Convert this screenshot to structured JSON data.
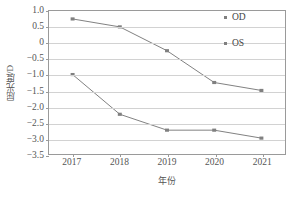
{
  "chart_data": {
    "type": "line",
    "title": "",
    "xlabel": "年份",
    "ylabel": "屈光度/D",
    "categories": [
      "2017",
      "2018",
      "2019",
      "2020",
      "2021"
    ],
    "series": [
      {
        "name": "OD",
        "values": [
          0.75,
          0.5,
          -0.25,
          -1.25,
          -1.5
        ],
        "marker": "square",
        "color": "#808080"
      },
      {
        "name": "OS",
        "values": [
          -1.0,
          -2.25,
          -2.75,
          -2.75,
          -3.0
        ],
        "marker": "square",
        "color": "#808080"
      }
    ],
    "ylim": [
      -3.5,
      1.0
    ],
    "ytick_labels": [
      "1.0",
      "0.5",
      "0",
      "-0.5",
      "-1.0",
      "-1.5",
      "-2.0",
      "-2.5",
      "-3.0",
      "-3.5"
    ],
    "ytick_values": [
      1.0,
      0.5,
      0,
      -0.5,
      -1.0,
      -1.5,
      -2.0,
      -2.5,
      -3.0,
      -3.5
    ],
    "grid": "horizontal",
    "legend_position": "top-right",
    "legend_entries": [
      "OD",
      "OS"
    ]
  },
  "axis": {
    "y_title": "屈光度/D",
    "x_title": "年份"
  },
  "colors": {
    "line": "#808080",
    "grid": "#d2d2d2",
    "frame": "#9a9a9a",
    "text": "#555555"
  }
}
